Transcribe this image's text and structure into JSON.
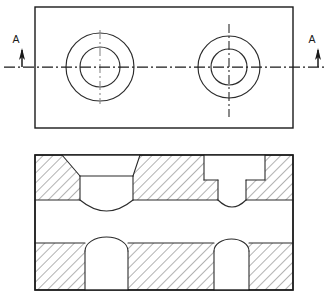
{
  "drawing": {
    "title": "Sectional View Drawing",
    "type": "orthographic-two-view",
    "section_label_left": "A",
    "section_label_right": "A",
    "line_color": "#1a1a1a",
    "feature_color": "#2b2b2b",
    "hatch_color": "#555555",
    "background_color": "#ffffff",
    "views": [
      {
        "name": "top-view",
        "kind": "plan",
        "outline": {
          "x": 35,
          "y": 7,
          "width": 258,
          "height": 121
        },
        "holes": [
          {
            "name": "left-counterbore",
            "center_x": 100,
            "center_y": 67,
            "outer_radius": 34,
            "inner_radius": 20
          },
          {
            "name": "right-counterbore",
            "center_x": 229,
            "center_y": 67,
            "outer_radius": 31,
            "inner_radius": 18
          }
        ],
        "centerline": {
          "name": "horizontal-section-line",
          "y": 67,
          "x_start": 4,
          "x_end": 324
        }
      },
      {
        "name": "section-view-a-a",
        "kind": "section",
        "outline": {
          "x": 35,
          "y": 155,
          "width": 258,
          "height": 135
        },
        "upper_band": {
          "y_top": 155,
          "y_bottom": 200
        },
        "middle_band": {
          "y_top": 200,
          "y_bottom": 243
        },
        "lower_band": {
          "y_top": 243,
          "y_bottom": 290
        },
        "features": [
          {
            "name": "left-countersunk-bore",
            "style": "chamfered",
            "top_left_x": 62,
            "top_right_x": 140,
            "wall_left_x": 80,
            "wall_right_x": 133,
            "chamfer_bottom_y": 176,
            "wall_bottom_y": 200,
            "round_bottom_y": 215
          },
          {
            "name": "right-counterbore",
            "style": "straight",
            "bore_left_x": 204,
            "bore_right_x": 265,
            "bore_bottom_y": 180,
            "hole_left_x": 218,
            "hole_right_x": 246,
            "hole_bottom_y": 200,
            "round_bottom_y": 209
          },
          {
            "name": "lower-left-dome-void",
            "left_x": 85,
            "right_x": 128,
            "dome_top_y": 238,
            "shoulder_y": 251,
            "bottom_y": 290
          },
          {
            "name": "lower-right-dome-void",
            "left_x": 214,
            "right_x": 249,
            "dome_top_y": 240,
            "shoulder_y": 251,
            "bottom_y": 290
          }
        ]
      }
    ],
    "section_markers": [
      {
        "name": "section-marker-left",
        "label": "A",
        "label_x": 16,
        "label_y": 43,
        "leader_x": 22,
        "leader_top_y": 52,
        "leader_bottom_y": 67,
        "arrow_direction": "up"
      },
      {
        "name": "section-marker-right",
        "label": "A",
        "label_x": 312,
        "label_y": 43,
        "leader_x": 318,
        "leader_top_y": 52,
        "leader_bottom_y": 67,
        "arrow_direction": "up"
      }
    ]
  }
}
